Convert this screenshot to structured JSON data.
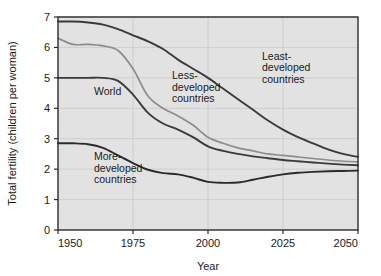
{
  "chart_data": {
    "type": "line",
    "title": "",
    "xlabel": "Year",
    "ylabel": "Total fertility (children per woman)",
    "xlim": [
      1950,
      2050
    ],
    "ylim": [
      0,
      7
    ],
    "xticks": [
      1950,
      1975,
      2000,
      2025,
      2050
    ],
    "yticks": [
      0,
      1,
      2,
      3,
      4,
      5,
      6,
      7
    ],
    "xtick_labels": [
      "1950",
      "1975",
      "2000",
      "2025",
      "2050"
    ],
    "ytick_labels": [
      "0",
      "1",
      "2",
      "3",
      "4",
      "5",
      "6",
      "7"
    ],
    "grid": true,
    "legend_position": "inline-annotations",
    "x": [
      1950,
      1955,
      1960,
      1965,
      1970,
      1975,
      1980,
      1985,
      1990,
      1995,
      2000,
      2005,
      2010,
      2015,
      2020,
      2025,
      2030,
      2035,
      2040,
      2045,
      2050
    ],
    "series": [
      {
        "name": "Least-developed countries",
        "color": "#3a3a3a",
        "label_text": "Least-\ndeveloped\ncountries",
        "values": [
          6.85,
          6.85,
          6.82,
          6.75,
          6.6,
          6.4,
          6.2,
          5.95,
          5.6,
          5.3,
          5.0,
          4.65,
          4.3,
          3.95,
          3.6,
          3.3,
          3.05,
          2.85,
          2.65,
          2.5,
          2.4
        ]
      },
      {
        "name": "Less-developed countries",
        "color": "#8c8c8c",
        "label_text": "Less-\ndeveloped\ncountries",
        "values": [
          6.3,
          6.1,
          6.1,
          6.05,
          5.9,
          5.3,
          4.4,
          4.0,
          3.75,
          3.45,
          3.05,
          2.85,
          2.7,
          2.6,
          2.5,
          2.45,
          2.4,
          2.35,
          2.3,
          2.26,
          2.24
        ]
      },
      {
        "name": "World",
        "color": "#3a3a3a",
        "label_text": "World",
        "values": [
          5.0,
          5.0,
          5.0,
          5.0,
          4.9,
          4.45,
          3.85,
          3.5,
          3.3,
          3.05,
          2.75,
          2.6,
          2.5,
          2.42,
          2.36,
          2.3,
          2.26,
          2.22,
          2.18,
          2.15,
          2.13
        ]
      },
      {
        "name": "More-developed countries",
        "color": "#2b2b2b",
        "label_text": "More-\ndeveloped\ncountries",
        "values": [
          2.85,
          2.85,
          2.82,
          2.7,
          2.45,
          2.2,
          1.98,
          1.87,
          1.83,
          1.72,
          1.58,
          1.55,
          1.56,
          1.65,
          1.75,
          1.83,
          1.88,
          1.91,
          1.93,
          1.94,
          1.95
        ]
      }
    ],
    "annotations": [
      {
        "text_lines": [
          "Less-",
          "developed",
          "countries"
        ],
        "x": 1988,
        "y": 4.95
      },
      {
        "text_lines": [
          "Least-",
          "developed",
          "countries"
        ],
        "x": 2018,
        "y": 5.6
      },
      {
        "text_lines": [
          "World"
        ],
        "x": 1962,
        "y": 4.45
      },
      {
        "text_lines": [
          "More-",
          "developed",
          "countries"
        ],
        "x": 1962,
        "y": 2.3
      }
    ],
    "colors": {
      "plot_background": "#e2e2e2",
      "page_background": "#ffffff",
      "grid": "#c9c9c9",
      "frame": "#2b2b2b",
      "text": "#1a1a1a"
    }
  }
}
